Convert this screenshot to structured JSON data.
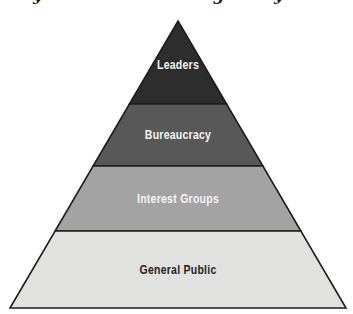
{
  "diagram": {
    "type": "pyramid",
    "levels": [
      {
        "label": "Leaders",
        "fill_color": "#2e2d2d",
        "text_color": "#f4f4f4"
      },
      {
        "label": "Bureaucracy",
        "fill_color": "#585858",
        "text_color": "#f4f4f4"
      },
      {
        "label": "Interest Groups",
        "fill_color": "#a3a3a3",
        "text_color": "#f4f4f4"
      },
      {
        "label": "General Public",
        "fill_color": "#e1e1df",
        "text_color": "#242424"
      }
    ],
    "outline_color": "#1c1c1c",
    "background_color": "#ffffff"
  },
  "top_cropped_text": {
    "note": "only descender fragments of a cropped title line are visible",
    "fragments": [
      "y",
      "g",
      "y"
    ]
  }
}
